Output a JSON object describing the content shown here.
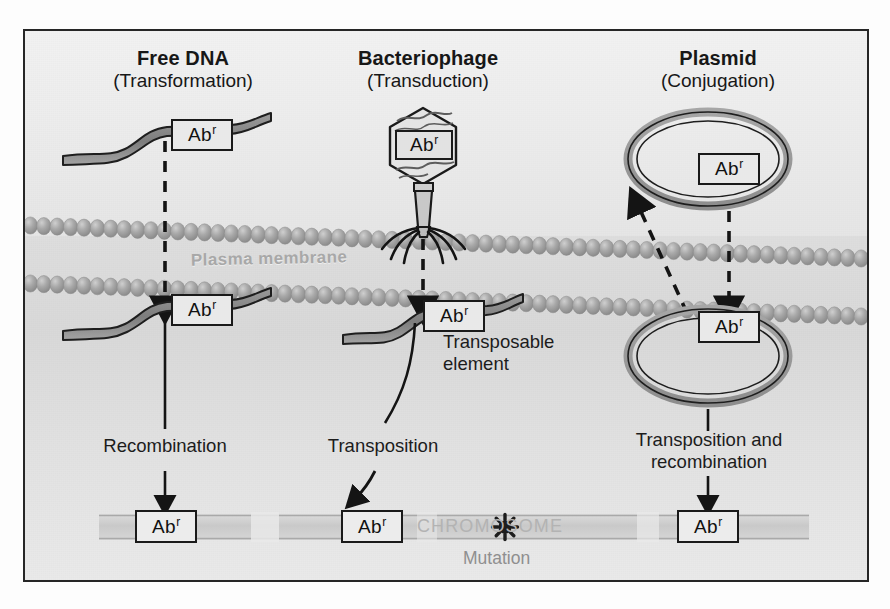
{
  "figure": {
    "title_columns": [
      {
        "id": "free-dna",
        "line1": "Free DNA",
        "line2": "(Transformation)"
      },
      {
        "id": "bacteriophage",
        "line1": "Bacteriophage",
        "line2": "(Transduction)"
      },
      {
        "id": "plasmid",
        "line1": "Plasmid",
        "line2": "(Conjugation)"
      }
    ],
    "gene_label": "Ab",
    "gene_superscript": "r",
    "membrane_label": "Plasma membrane",
    "chromosome_label": "CHROMOSOME",
    "mutation_label": "Mutation",
    "process_labels": {
      "recombination": "Recombination",
      "transposable_element": "Transposable\nelement",
      "transposition": "Transposition",
      "transposition_and_recombination": "Transposition and\nrecombination"
    },
    "colors": {
      "outline": "#1a1a1a",
      "membrane_bead": "#9d9d9d",
      "chromosome_band": "#cfcfcf",
      "dna_ribbon": "#8c8c8c",
      "background_outside": "#ededed",
      "background_cytoplasm": "#dcdcdc",
      "frame_border": "#262626"
    },
    "icons": {
      "mutation": "starburst-icon",
      "phage": "bacteriophage-icon",
      "plasmid": "plasmid-ring-icon",
      "dna": "dna-strand-icon",
      "membrane": "phospholipid-bilayer-icon"
    }
  }
}
